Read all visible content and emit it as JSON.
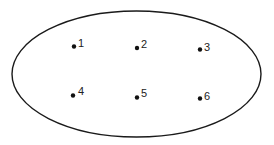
{
  "diagram": {
    "type": "set-diagram",
    "boundary": {
      "shape": "ellipse",
      "cx": 136.5,
      "cy": 74,
      "rx": 124.5,
      "ry": 63,
      "stroke": "#1a1a1a"
    },
    "points": [
      {
        "label": "1",
        "x": 74,
        "y": 46
      },
      {
        "label": "2",
        "x": 137,
        "y": 48
      },
      {
        "label": "3",
        "x": 200,
        "y": 49
      },
      {
        "label": "4",
        "x": 73,
        "y": 95
      },
      {
        "label": "5",
        "x": 137,
        "y": 97
      },
      {
        "label": "6",
        "x": 200,
        "y": 98
      }
    ],
    "point_color": "#111111"
  }
}
